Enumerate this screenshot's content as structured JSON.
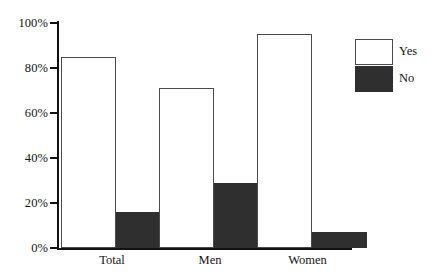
{
  "chart_data": {
    "type": "bar",
    "title": "",
    "subtitle": "",
    "xlabel": "",
    "ylabel": "",
    "categories": [
      "Total",
      "Men",
      "Women"
    ],
    "series": [
      {
        "name": "Yes",
        "values": [
          85,
          71,
          95
        ],
        "color": "#ffffff",
        "border": "#4a4a4a"
      },
      {
        "name": "No",
        "values": [
          16,
          29,
          7
        ],
        "color": "#2f2f2f",
        "border": "#2f2f2f"
      }
    ],
    "ylim": [
      0,
      100
    ],
    "yticks": [
      0,
      20,
      40,
      60,
      80,
      100
    ],
    "ytick_labels": [
      "0%",
      "20%",
      "40%",
      "60%",
      "80%",
      "100%"
    ],
    "grid": false,
    "legend_position": "right-top",
    "legend_entries": [
      "Yes",
      "No"
    ],
    "value_suffix": "%"
  }
}
